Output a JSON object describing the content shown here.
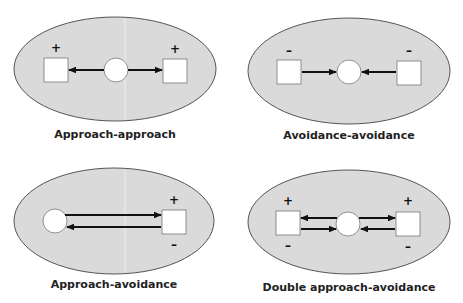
{
  "figure": {
    "colors": {
      "ellipse_fill": "#dadada",
      "ellipse_stroke": "#555555",
      "node_fill": "#ffffff",
      "arrow": "#111111",
      "text": "#222222"
    },
    "panels": [
      {
        "id": "approach-approach",
        "label": "Approach-approach",
        "goals": [
          {
            "side": "left",
            "valence_top": "+",
            "valence_bottom": ""
          },
          {
            "side": "right",
            "valence_top": "+",
            "valence_bottom": ""
          }
        ],
        "arrows": [
          "person → left goal",
          "person → right goal"
        ]
      },
      {
        "id": "avoidance-avoidance",
        "label": "Avoidance-avoidance",
        "goals": [
          {
            "side": "left",
            "valence_top": "–",
            "valence_bottom": ""
          },
          {
            "side": "right",
            "valence_top": "–",
            "valence_bottom": ""
          }
        ],
        "arrows": [
          "left goal → person",
          "right goal → person"
        ]
      },
      {
        "id": "approach-avoidance",
        "label": "Approach-avoidance",
        "goals": [
          {
            "side": "right",
            "valence_top": "+",
            "valence_bottom": "–"
          }
        ],
        "arrows": [
          "person → goal",
          "goal → person"
        ]
      },
      {
        "id": "double-approach-avoidance",
        "label": "Double approach-avoidance",
        "goals": [
          {
            "side": "left",
            "valence_top": "+",
            "valence_bottom": "–"
          },
          {
            "side": "right",
            "valence_top": "+",
            "valence_bottom": "–"
          }
        ],
        "arrows": [
          "person → left goal",
          "left goal → person",
          "person → right goal",
          "right goal → person"
        ]
      }
    ]
  }
}
